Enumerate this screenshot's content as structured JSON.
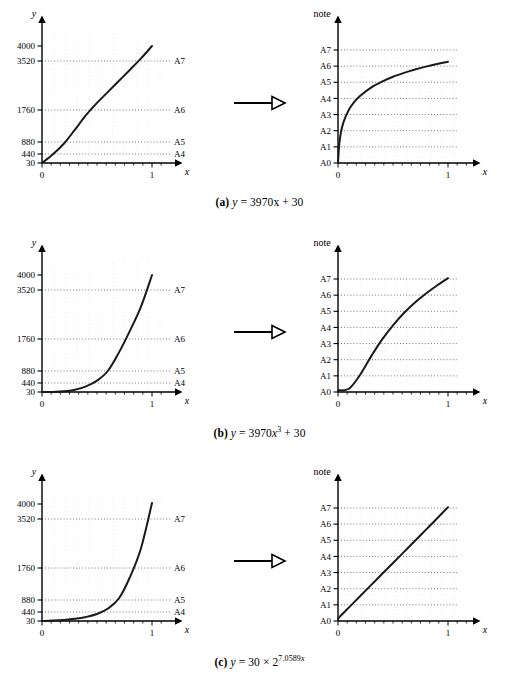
{
  "figure": {
    "rows": [
      {
        "id": "row-a",
        "caption_label": "(a)",
        "caption_formula_pre": "y",
        "caption_formula_eq": "=",
        "caption_formula_body": "3970x + 30",
        "caption_exponent": "",
        "caption_full": "(a) y = 3970x + 30",
        "left": {
          "ylabel": "y",
          "xlabel": "x",
          "ytick_labels": [
            "4000",
            "3520",
            "1760",
            "880",
            "440",
            "30"
          ],
          "ytick_values": [
            4000,
            3520,
            1760,
            880,
            440,
            30
          ],
          "note_labels": [
            "A7",
            "A6",
            "A5",
            "A4"
          ],
          "note_values": [
            3520,
            1760,
            880,
            440
          ],
          "xtick_labels": [
            "0",
            "1"
          ],
          "xtick_values": [
            0,
            1
          ]
        },
        "right": {
          "ylabel": "note",
          "xlabel": "x",
          "ytick_labels": [
            "A7",
            "A6",
            "A5",
            "A4",
            "A3",
            "A2",
            "A1",
            "A0"
          ],
          "xtick_labels": [
            "0",
            "1"
          ]
        }
      },
      {
        "id": "row-b",
        "caption_label": "(b)",
        "caption_formula_pre": "y",
        "caption_formula_eq": "=",
        "caption_formula_body": "3970x",
        "caption_exponent": "3",
        "caption_tail": " + 30",
        "caption_full": "(b) y = 3970x3 + 30",
        "left": {
          "ylabel": "y",
          "xlabel": "x",
          "ytick_labels": [
            "4000",
            "3520",
            "1760",
            "880",
            "440",
            "30"
          ],
          "ytick_values": [
            4000,
            3520,
            1760,
            880,
            440,
            30
          ],
          "note_labels": [
            "A7",
            "A6",
            "A5",
            "A4"
          ],
          "note_values": [
            3520,
            1760,
            880,
            440
          ],
          "xtick_labels": [
            "0",
            "1"
          ],
          "xtick_values": [
            0,
            1
          ]
        },
        "right": {
          "ylabel": "note",
          "xlabel": "x",
          "ytick_labels": [
            "A7",
            "A6",
            "A5",
            "A4",
            "A3",
            "A2",
            "A1",
            "A0"
          ],
          "xtick_labels": [
            "0",
            "1"
          ]
        }
      },
      {
        "id": "row-c",
        "caption_label": "(c)",
        "caption_formula_pre": "y",
        "caption_formula_eq": "=",
        "caption_formula_body": "30 × 2",
        "caption_exponent": "7.0589x",
        "caption_tail": "",
        "caption_full": "(c) y = 30 × 27.0589x",
        "left": {
          "ylabel": "y",
          "xlabel": "x",
          "ytick_labels": [
            "4000",
            "3520",
            "1760",
            "880",
            "440",
            "30"
          ],
          "ytick_values": [
            4000,
            3520,
            1760,
            880,
            440,
            30
          ],
          "note_labels": [
            "A7",
            "A6",
            "A5",
            "A4"
          ],
          "note_values": [
            3520,
            1760,
            880,
            440
          ],
          "xtick_labels": [
            "0",
            "1"
          ],
          "xtick_values": [
            0,
            1
          ]
        },
        "right": {
          "ylabel": "note",
          "xlabel": "x",
          "ytick_labels": [
            "A7",
            "A6",
            "A5",
            "A4",
            "A3",
            "A2",
            "A1",
            "A0"
          ],
          "xtick_labels": [
            "0",
            "1"
          ]
        }
      }
    ],
    "arrow_count": 3
  },
  "colors": {
    "ink": "#000000",
    "curve": "#1a1a1a",
    "grid": "#9a9a9a",
    "gridfaint": "#c8c8c8"
  },
  "chart_data": [
    {
      "type": "line",
      "id": "a-left",
      "title": "",
      "xlabel": "x",
      "ylabel": "y",
      "xlim": [
        0,
        1.12
      ],
      "ylim": [
        30,
        4300
      ],
      "yscale": "linear-piecewise-by-note",
      "grid": true,
      "yticks": [
        30,
        440,
        880,
        1760,
        3520,
        4000
      ],
      "yticklabels": [
        "30",
        "440",
        "880",
        "1760",
        "3520",
        "4000"
      ],
      "note_gridlines": [
        {
          "label": "A4",
          "value": 440
        },
        {
          "label": "A5",
          "value": 880
        },
        {
          "label": "A6",
          "value": 1760
        },
        {
          "label": "A7",
          "value": 3520
        }
      ],
      "xticks": [
        0,
        1
      ],
      "xticklabels": [
        "0",
        "1"
      ],
      "series": [
        {
          "name": "y = 3970x + 30",
          "x": [
            0,
            0.1,
            0.2,
            0.3,
            0.4,
            0.5,
            0.6,
            0.7,
            0.8,
            0.9,
            1.0
          ],
          "y": [
            30,
            427,
            824,
            1221,
            1618,
            2015,
            2412,
            2809,
            3206,
            3603,
            4000
          ]
        }
      ]
    },
    {
      "type": "line",
      "id": "a-right",
      "title": "",
      "xlabel": "x",
      "ylabel": "note",
      "xlim": [
        0,
        1.12
      ],
      "ylim": [
        0,
        7.4
      ],
      "grid": true,
      "yticks": [
        0,
        1,
        2,
        3,
        4,
        5,
        6,
        7
      ],
      "yticklabels": [
        "A0",
        "A1",
        "A2",
        "A3",
        "A4",
        "A5",
        "A6",
        "A7"
      ],
      "xticks": [
        0,
        1
      ],
      "xticklabels": [
        "0",
        "1"
      ],
      "series": [
        {
          "name": "note(3970x + 30)",
          "x": [
            0,
            0.01,
            0.025,
            0.05,
            0.1,
            0.15,
            0.2,
            0.3,
            0.4,
            0.5,
            0.6,
            0.7,
            0.8,
            0.9,
            1.0
          ],
          "y": [
            0.0,
            1.05,
            1.84,
            2.53,
            3.31,
            3.8,
            4.15,
            4.67,
            5.04,
            5.34,
            5.58,
            5.79,
            5.97,
            6.13,
            6.27
          ]
        }
      ]
    },
    {
      "type": "line",
      "id": "b-left",
      "title": "",
      "xlabel": "x",
      "ylabel": "y",
      "xlim": [
        0,
        1.12
      ],
      "ylim": [
        30,
        4300
      ],
      "grid": true,
      "yticks": [
        30,
        440,
        880,
        1760,
        3520,
        4000
      ],
      "yticklabels": [
        "30",
        "440",
        "880",
        "1760",
        "3520",
        "4000"
      ],
      "note_gridlines": [
        {
          "label": "A4",
          "value": 440
        },
        {
          "label": "A5",
          "value": 880
        },
        {
          "label": "A6",
          "value": 1760
        },
        {
          "label": "A7",
          "value": 3520
        }
      ],
      "xticks": [
        0,
        1
      ],
      "xticklabels": [
        "0",
        "1"
      ],
      "series": [
        {
          "name": "y = 3970x^3 + 30",
          "x": [
            0,
            0.1,
            0.2,
            0.3,
            0.4,
            0.5,
            0.6,
            0.7,
            0.8,
            0.9,
            1.0
          ],
          "y": [
            30,
            34,
            62,
            137,
            284,
            526,
            887,
            1392,
            2063,
            2924,
            4000
          ]
        }
      ]
    },
    {
      "type": "line",
      "id": "b-right",
      "title": "",
      "xlabel": "x",
      "ylabel": "note",
      "xlim": [
        0,
        1.12
      ],
      "ylim": [
        0,
        7.4
      ],
      "grid": true,
      "yticks": [
        0,
        1,
        2,
        3,
        4,
        5,
        6,
        7
      ],
      "yticklabels": [
        "A0",
        "A1",
        "A2",
        "A3",
        "A4",
        "A5",
        "A6",
        "A7"
      ],
      "xticks": [
        0,
        1
      ],
      "xticklabels": [
        "0",
        "1"
      ],
      "series": [
        {
          "name": "note(3970x^3 + 30)",
          "x": [
            0,
            0.1,
            0.2,
            0.3,
            0.4,
            0.5,
            0.6,
            0.7,
            0.8,
            0.9,
            1.0
          ],
          "y": [
            0.1,
            0.2,
            1.05,
            2.19,
            3.24,
            4.13,
            4.89,
            5.54,
            6.1,
            6.6,
            7.05
          ]
        }
      ]
    },
    {
      "type": "line",
      "id": "c-left",
      "title": "",
      "xlabel": "x",
      "ylabel": "y",
      "xlim": [
        0,
        1.12
      ],
      "ylim": [
        30,
        4300
      ],
      "grid": true,
      "yticks": [
        30,
        440,
        880,
        1760,
        3520,
        4000
      ],
      "yticklabels": [
        "30",
        "440",
        "880",
        "1760",
        "3520",
        "4000"
      ],
      "note_gridlines": [
        {
          "label": "A4",
          "value": 440
        },
        {
          "label": "A5",
          "value": 880
        },
        {
          "label": "A6",
          "value": 1760
        },
        {
          "label": "A7",
          "value": 3520
        }
      ],
      "xticks": [
        0,
        1
      ],
      "xticklabels": [
        "0",
        "1"
      ],
      "series": [
        {
          "name": "y = 30 x 2^(7.0589x)",
          "x": [
            0,
            0.1,
            0.2,
            0.3,
            0.4,
            0.5,
            0.6,
            0.7,
            0.8,
            0.9,
            1.0
          ],
          "y": [
            30,
            49,
            80,
            131,
            213,
            348,
            568,
            927,
            1513,
            2469,
            4029
          ]
        }
      ]
    },
    {
      "type": "line",
      "id": "c-right",
      "title": "",
      "xlabel": "x",
      "ylabel": "note",
      "xlim": [
        0,
        1.12
      ],
      "ylim": [
        0,
        7.4
      ],
      "grid": true,
      "yticks": [
        0,
        1,
        2,
        3,
        4,
        5,
        6,
        7
      ],
      "yticklabels": [
        "A0",
        "A1",
        "A2",
        "A3",
        "A4",
        "A5",
        "A6",
        "A7"
      ],
      "xticks": [
        0,
        1
      ],
      "xticklabels": [
        "0",
        "1"
      ],
      "series": [
        {
          "name": "note(30 x 2^(7.0589x))",
          "x": [
            0,
            0.1,
            0.2,
            0.3,
            0.4,
            0.5,
            0.6,
            0.7,
            0.8,
            0.9,
            1.0
          ],
          "y": [
            0.15,
            0.84,
            1.53,
            2.22,
            2.91,
            3.59,
            4.28,
            4.97,
            5.66,
            6.35,
            7.05
          ]
        }
      ]
    }
  ]
}
